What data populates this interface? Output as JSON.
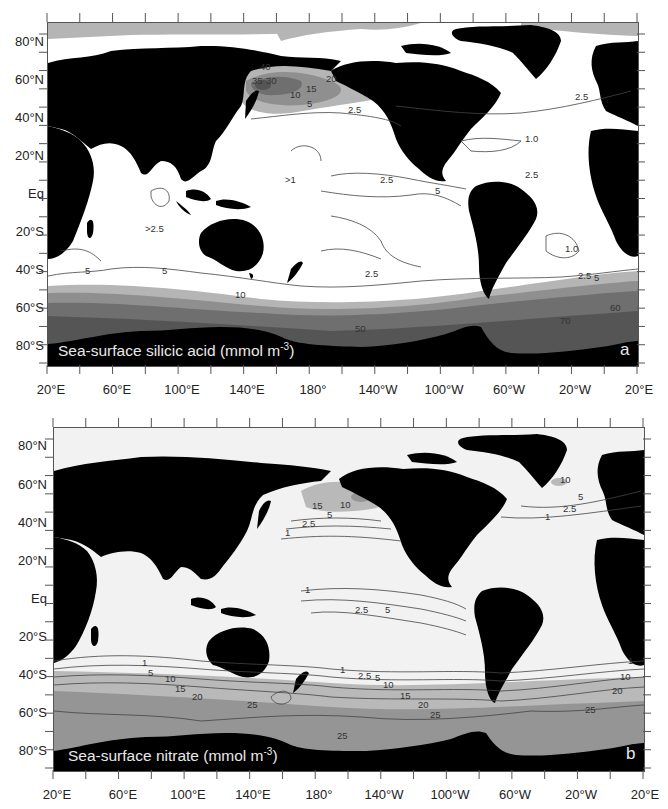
{
  "figure": {
    "panels": [
      {
        "id": "a",
        "letter": "a",
        "caption_main": "Sea-surface silicic acid (mmol m",
        "caption_sup": "-3",
        "caption_end": ")",
        "colors": {
          "ocean": "#ffffff",
          "land": "#000000",
          "shade1": "#b5b5b5",
          "shade2": "#8f8f8f",
          "shade3": "#6f6f6f",
          "shade4": "#555555",
          "contour": "#444444"
        },
        "contour_labels": [
          {
            "text": "40",
            "x": 260,
            "y": 70
          },
          {
            "text": "35",
            "x": 252,
            "y": 84
          },
          {
            "text": "30",
            "x": 266,
            "y": 84
          },
          {
            "text": "20",
            "x": 326,
            "y": 82
          },
          {
            "text": "15",
            "x": 306,
            "y": 92
          },
          {
            "text": "10",
            "x": 290,
            "y": 98
          },
          {
            "text": "5",
            "x": 307,
            "y": 107
          },
          {
            "text": "2.5",
            "x": 348,
            "y": 113
          },
          {
            "text": "2.5",
            "x": 575,
            "y": 100
          },
          {
            "text": "1.0",
            "x": 525,
            "y": 142
          },
          {
            "text": "2.5",
            "x": 525,
            "y": 178
          },
          {
            "text": ">1",
            "x": 285,
            "y": 183
          },
          {
            "text": "2.5",
            "x": 380,
            "y": 183
          },
          {
            "text": "5",
            "x": 435,
            "y": 194
          },
          {
            "text": "1.0",
            "x": 565,
            "y": 252
          },
          {
            "text": "2.5",
            "x": 578,
            "y": 279
          },
          {
            "text": "5",
            "x": 594,
            "y": 281
          },
          {
            "text": ">2.5",
            "x": 145,
            "y": 232
          },
          {
            "text": "5",
            "x": 85,
            "y": 274
          },
          {
            "text": "5",
            "x": 162,
            "y": 274
          },
          {
            "text": "2.5",
            "x": 365,
            "y": 277
          },
          {
            "text": "10",
            "x": 235,
            "y": 298
          },
          {
            "text": "50",
            "x": 355,
            "y": 332
          },
          {
            "text": "70",
            "x": 560,
            "y": 324
          },
          {
            "text": "60",
            "x": 610,
            "y": 311
          }
        ]
      },
      {
        "id": "b",
        "letter": "b",
        "caption_main": "Sea-surface nitrate (mmol m",
        "caption_sup": "-3",
        "caption_end": ")",
        "colors": {
          "ocean": "#f2f2f2",
          "land": "#000000",
          "shade1": "#b9b9b9",
          "shade2": "#959595",
          "contour": "#444444"
        },
        "contour_labels": [
          {
            "text": "15",
            "x": 312,
            "y": 509
          },
          {
            "text": "10",
            "x": 340,
            "y": 508
          },
          {
            "text": "5",
            "x": 327,
            "y": 518
          },
          {
            "text": "2.5",
            "x": 302,
            "y": 527
          },
          {
            "text": "1",
            "x": 285,
            "y": 536
          },
          {
            "text": "10",
            "x": 560,
            "y": 483
          },
          {
            "text": "5",
            "x": 578,
            "y": 500
          },
          {
            "text": "2.5",
            "x": 563,
            "y": 512
          },
          {
            "text": "1",
            "x": 545,
            "y": 520
          },
          {
            "text": "1",
            "x": 305,
            "y": 593
          },
          {
            "text": "2.5",
            "x": 355,
            "y": 613
          },
          {
            "text": "5",
            "x": 385,
            "y": 613
          },
          {
            "text": "1",
            "x": 142,
            "y": 666
          },
          {
            "text": "5",
            "x": 148,
            "y": 676
          },
          {
            "text": "10",
            "x": 165,
            "y": 682
          },
          {
            "text": "15",
            "x": 175,
            "y": 692
          },
          {
            "text": "20",
            "x": 192,
            "y": 700
          },
          {
            "text": "25",
            "x": 247,
            "y": 708
          },
          {
            "text": "1",
            "x": 340,
            "y": 673
          },
          {
            "text": "2.5",
            "x": 358,
            "y": 679
          },
          {
            "text": "5",
            "x": 375,
            "y": 681
          },
          {
            "text": "10",
            "x": 383,
            "y": 688
          },
          {
            "text": "15",
            "x": 400,
            "y": 699
          },
          {
            "text": "20",
            "x": 418,
            "y": 708
          },
          {
            "text": "25",
            "x": 430,
            "y": 718
          },
          {
            "text": "25",
            "x": 337,
            "y": 739
          },
          {
            "text": "25",
            "x": 585,
            "y": 713
          },
          {
            "text": "20",
            "x": 612,
            "y": 694
          },
          {
            "text": "10",
            "x": 620,
            "y": 680
          },
          {
            "text": "1",
            "x": 628,
            "y": 664
          }
        ]
      }
    ],
    "y_axis_labels": [
      "80°N",
      "60°N",
      "40°N",
      "20°N",
      "Eq",
      "20°S",
      "40°S",
      "60°S",
      "80°S"
    ],
    "x_axis_labels": [
      "20°E",
      "60°E",
      "100°E",
      "140°E",
      "180°",
      "140°W",
      "100°W",
      "60°W",
      "20°W",
      "20°E"
    ]
  },
  "chart_data": [
    {
      "type": "heatmap",
      "title": "Sea-surface silicic acid (mmol m-3)",
      "panel": "a",
      "xlabel": "Longitude",
      "ylabel": "Latitude",
      "x_ticks": [
        "20°E",
        "60°E",
        "100°E",
        "140°E",
        "180°",
        "140°W",
        "100°W",
        "60°W",
        "20°W",
        "20°E"
      ],
      "y_ticks": [
        "80°N",
        "60°N",
        "40°N",
        "20°N",
        "Eq",
        "20°S",
        "40°S",
        "60°S",
        "80°S"
      ],
      "contour_levels": [
        1.0,
        2.5,
        5,
        10,
        15,
        20,
        30,
        35,
        40,
        50,
        60,
        70
      ],
      "annotations": [
        ">1 (central Pacific)",
        ">2.5 (Indian Ocean)"
      ],
      "regions": [
        {
          "region": "North Pacific subarctic",
          "range": "10–40"
        },
        {
          "region": "Southern Ocean",
          "range": "10–70"
        },
        {
          "region": "Subtropical gyres",
          "range": "1.0–2.5"
        }
      ]
    },
    {
      "type": "heatmap",
      "title": "Sea-surface nitrate (mmol m-3)",
      "panel": "b",
      "xlabel": "Longitude",
      "ylabel": "Latitude",
      "x_ticks": [
        "20°E",
        "60°E",
        "100°E",
        "140°E",
        "180°",
        "140°W",
        "100°W",
        "60°W",
        "20°W",
        "20°E"
      ],
      "y_ticks": [
        "80°N",
        "60°N",
        "40°N",
        "20°N",
        "Eq",
        "20°S",
        "40°S",
        "60°S",
        "80°S"
      ],
      "contour_levels": [
        1,
        2.5,
        5,
        10,
        15,
        20,
        25
      ],
      "regions": [
        {
          "region": "North Pacific subarctic",
          "range": "10–15"
        },
        {
          "region": "North Atlantic subpolar",
          "range": "5–10"
        },
        {
          "region": "Equatorial Pacific",
          "range": "1–5"
        },
        {
          "region": "Southern Ocean",
          "range": "15–25"
        }
      ]
    }
  ]
}
